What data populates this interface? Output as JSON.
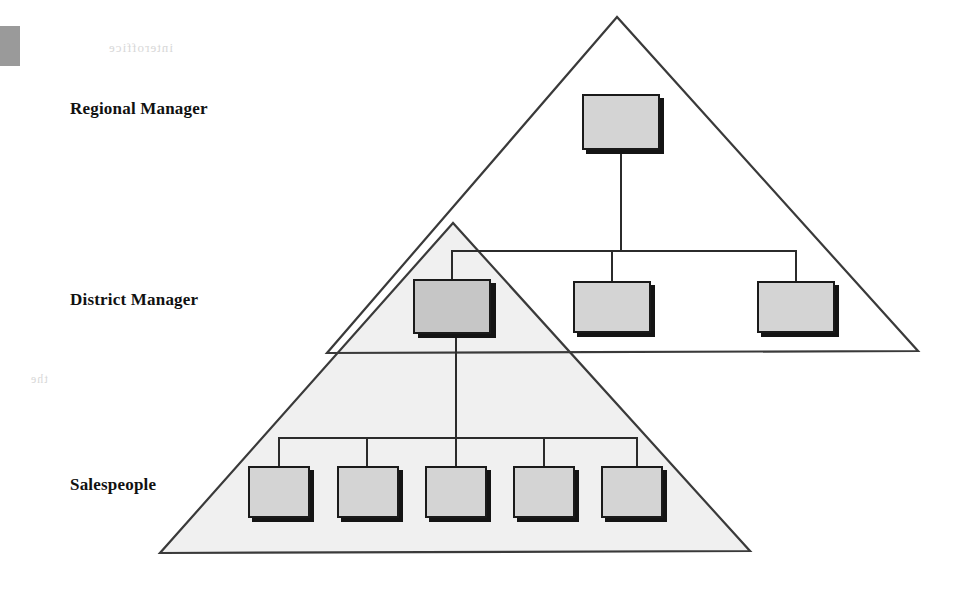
{
  "diagram": {
    "type": "organizational-hierarchy-triangles",
    "title_labels": {
      "regional": "Regional Manager",
      "district": "District Manager",
      "salespeople": "Salespeople"
    },
    "colors": {
      "box_fill": "#d4d4d4",
      "box_fill_overlap": "#c6c6c6",
      "box_border": "#1a1a1a",
      "box_shadow": "#141414",
      "triangle_stroke": "#3a3a3a",
      "lower_triangle_fill": "#f0f0f0",
      "upper_triangle_fill": "#ffffff",
      "connector_stroke": "#2b2b2b",
      "page_background": "#ffffff",
      "scan_mark": "#9a9a9a"
    },
    "triangles": [
      {
        "name": "upper-triangle",
        "label": "Regional manager span of control",
        "apex": [
          617,
          17
        ],
        "base_left": [
          327,
          353
        ],
        "base_right": [
          918,
          351
        ],
        "fill": "none"
      },
      {
        "name": "lower-triangle",
        "label": "District manager span of control",
        "apex": [
          453,
          223
        ],
        "base_left": [
          160,
          553
        ],
        "base_right": [
          750,
          551
        ],
        "fill": "#f0f0f0"
      }
    ],
    "levels": [
      {
        "name": "regional",
        "label": "Regional Manager",
        "count": 1,
        "boxes": [
          {
            "name": "regional-manager-box",
            "x": 582,
            "y": 94,
            "w": 78,
            "h": 56,
            "overlap": false
          }
        ]
      },
      {
        "name": "district",
        "label": "District Manager",
        "count": 3,
        "boxes": [
          {
            "name": "district-manager-box-1",
            "x": 413,
            "y": 279,
            "w": 78,
            "h": 55,
            "overlap": true
          },
          {
            "name": "district-manager-box-2",
            "x": 573,
            "y": 281,
            "w": 78,
            "h": 52,
            "overlap": false
          },
          {
            "name": "district-manager-box-3",
            "x": 757,
            "y": 281,
            "w": 78,
            "h": 52,
            "overlap": false
          }
        ]
      },
      {
        "name": "salespeople",
        "label": "Salespeople",
        "count": 5,
        "boxes": [
          {
            "name": "salesperson-box-1",
            "x": 248,
            "y": 466,
            "w": 62,
            "h": 52,
            "overlap": false
          },
          {
            "name": "salesperson-box-2",
            "x": 337,
            "y": 466,
            "w": 62,
            "h": 52,
            "overlap": false
          },
          {
            "name": "salesperson-box-3",
            "x": 425,
            "y": 466,
            "w": 62,
            "h": 52,
            "overlap": false
          },
          {
            "name": "salesperson-box-4",
            "x": 513,
            "y": 466,
            "w": 62,
            "h": 52,
            "overlap": false
          },
          {
            "name": "salesperson-box-5",
            "x": 601,
            "y": 466,
            "w": 62,
            "h": 52,
            "overlap": false
          }
        ]
      }
    ],
    "connectors": {
      "regional_to_district": {
        "stem_from_box": [
          621,
          150
        ],
        "bus_y": 251,
        "bus_x_start": 452,
        "bus_x_end": 796,
        "drops_x": [
          452,
          612,
          796
        ]
      },
      "district_to_salespeople": {
        "stem_from_box": [
          458,
          334
        ],
        "bus_y": 438,
        "bus_x_start": 279,
        "bus_x_end": 637,
        "drops_x": [
          279,
          367,
          456,
          544,
          637
        ]
      }
    },
    "ghost_text": {
      "top": "interoffice",
      "mid_1": "managing the",
      "mid_2": "level",
      "left_low": "the"
    }
  }
}
